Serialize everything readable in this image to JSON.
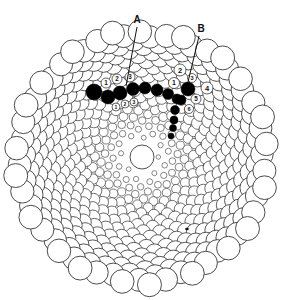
{
  "figure": {
    "background": "#ffffff",
    "stroke_color": "#222222",
    "fill_highlight": "#000000",
    "center": [
      142,
      157
    ],
    "outer_radius": 128,
    "hole_radius": 12,
    "golden_angle_deg": 137.508,
    "spiral_count": 520,
    "spiral_inner_r": 14,
    "min_circle_r": 2.2,
    "max_circle_r": 12.5
  },
  "labels": [
    {
      "text": "A",
      "x": 137,
      "y": 25,
      "line": [
        137,
        27,
        126,
        86
      ]
    },
    {
      "text": "B",
      "x": 201,
      "y": 34,
      "line": [
        199,
        36,
        188,
        82
      ]
    }
  ],
  "highlighted_circles": [
    {
      "x": 94,
      "y": 92,
      "r": 8
    },
    {
      "x": 108,
      "y": 97,
      "r": 7
    },
    {
      "x": 120,
      "y": 93,
      "r": 7
    },
    {
      "x": 133,
      "y": 89,
      "r": 6.5
    },
    {
      "x": 145,
      "y": 88,
      "r": 6
    },
    {
      "x": 157,
      "y": 90,
      "r": 6
    },
    {
      "x": 168,
      "y": 94,
      "r": 5.5
    },
    {
      "x": 177,
      "y": 99,
      "r": 5
    },
    {
      "x": 188,
      "y": 89,
      "r": 7
    },
    {
      "x": 181,
      "y": 100,
      "r": 5
    },
    {
      "x": 175,
      "y": 110,
      "r": 4.5
    },
    {
      "x": 174,
      "y": 120,
      "r": 4
    },
    {
      "x": 173,
      "y": 128,
      "r": 3.5
    },
    {
      "x": 171,
      "y": 136,
      "r": 3
    }
  ],
  "numbered_circles": {
    "spiral_upper_left": [
      {
        "n": "1",
        "x": 106,
        "y": 83,
        "r": 5
      },
      {
        "n": "2",
        "x": 117,
        "y": 79,
        "r": 5
      },
      {
        "n": "3",
        "x": 130,
        "y": 77,
        "r": 5
      }
    ],
    "spiral_lower_left": [
      {
        "n": "1",
        "x": 116,
        "y": 107,
        "r": 4
      },
      {
        "n": "2",
        "x": 125,
        "y": 104,
        "r": 4
      },
      {
        "n": "3",
        "x": 134,
        "y": 102,
        "r": 4
      }
    ],
    "spiral_right": [
      {
        "n": "1",
        "x": 174,
        "y": 83,
        "r": 5.5
      },
      {
        "n": "2",
        "x": 180,
        "y": 70,
        "r": 6
      },
      {
        "n": "3",
        "x": 192,
        "y": 78,
        "r": 4.5
      },
      {
        "n": "4",
        "x": 207,
        "y": 88,
        "r": 6
      },
      {
        "n": "5",
        "x": 196,
        "y": 99,
        "r": 5
      },
      {
        "n": "6",
        "x": 189,
        "y": 109,
        "r": 4.5
      }
    ]
  },
  "stray_mark": {
    "x": 187,
    "y": 229
  }
}
